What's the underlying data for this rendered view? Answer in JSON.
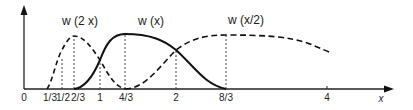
{
  "figure": {
    "type": "scaled-wavelet-functions",
    "x_axis": {
      "label": "x",
      "ticks": [
        {
          "value": 0,
          "label": "0"
        },
        {
          "value": 0.3333,
          "label": "1/3"
        },
        {
          "value": 0.5,
          "label": "1/2"
        },
        {
          "value": 0.6667,
          "label": "2/3"
        },
        {
          "value": 1,
          "label": "1"
        },
        {
          "value": 1.3333,
          "label": "4/3"
        },
        {
          "value": 2,
          "label": "2"
        },
        {
          "value": 2.6667,
          "label": "8/3"
        },
        {
          "value": 4,
          "label": "4"
        }
      ]
    },
    "curves": [
      {
        "name": "w(2x)",
        "style": "dashed",
        "support": [
          0.3333,
          1.3333
        ],
        "peak_at": "2/3"
      },
      {
        "name": "w(x)",
        "style": "solid",
        "support": [
          0.6667,
          2.6667
        ],
        "peak_at": "4/3"
      },
      {
        "name": "w(x/2)",
        "style": "dashed",
        "support": [
          1.3333,
          5.3333
        ],
        "peak_at": "8/3"
      }
    ],
    "labels": {
      "w2x": "w (2 x)",
      "wx": "w (x)",
      "wx2": "w (x/2)",
      "x_axis": "x"
    },
    "tick_labels": [
      "0",
      "1/3",
      "1/2",
      "2/3",
      "1",
      "4/3",
      "2",
      "8/3",
      "4"
    ],
    "colors": {
      "ink": "#111111",
      "background": "#ffffff"
    }
  }
}
